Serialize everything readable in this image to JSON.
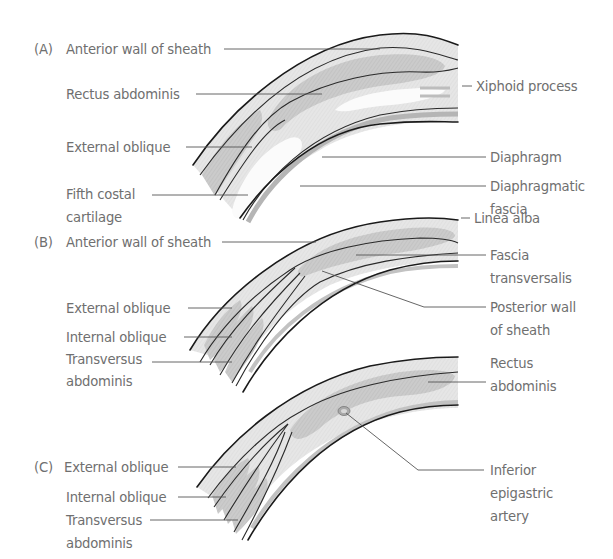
{
  "figure": {
    "colors": {
      "background": "#ffffff",
      "label_text": "#6f6f6f",
      "outline": "#1a1a1a",
      "muscle_fill": "#c9c9c9",
      "sheath_fill": "#ececec",
      "cartilage_fill": "#fafafa"
    }
  },
  "panels": [
    {
      "id": "A",
      "marker": "(A)",
      "left_labels": [
        {
          "text": "Anterior wall of sheath"
        },
        {
          "text": "Rectus abdominis"
        },
        {
          "text": "External oblique"
        },
        {
          "lines": [
            "Fifth costal",
            "cartilage"
          ]
        }
      ],
      "right_labels": [
        {
          "text": "Xiphoid process"
        },
        {
          "text": "Diaphragm"
        },
        {
          "lines": [
            "Diaphragmatic",
            "fascia"
          ]
        }
      ]
    },
    {
      "id": "B",
      "marker": "(B)",
      "left_labels": [
        {
          "text": "Anterior wall of sheath"
        },
        {
          "text": "External oblique"
        },
        {
          "text": "Internal oblique"
        },
        {
          "lines": [
            "Transversus",
            "abdominis"
          ]
        }
      ],
      "right_labels": [
        {
          "text": "Linea alba"
        },
        {
          "lines": [
            "Fascia",
            "transversalis"
          ]
        },
        {
          "lines": [
            "Posterior wall",
            "of sheath"
          ]
        }
      ]
    },
    {
      "id": "C",
      "marker": "(C)",
      "left_labels": [
        {
          "text": "External oblique"
        },
        {
          "text": "Internal oblique"
        },
        {
          "lines": [
            "Transversus",
            "abdominis"
          ]
        }
      ],
      "right_labels": [
        {
          "lines": [
            "Rectus",
            "abdominis"
          ]
        },
        {
          "lines": [
            "Inferior",
            "epigastric",
            "artery"
          ]
        }
      ]
    }
  ]
}
